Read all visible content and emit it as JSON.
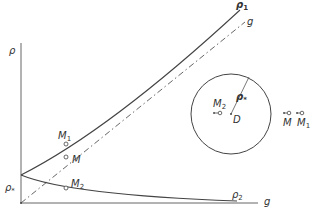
{
  "diagram": {
    "axes": {
      "y_label": "ρ",
      "x_label": "g"
    },
    "curves": {
      "upper": {
        "label": "ρ",
        "sub": "1"
      },
      "reference": {
        "label": "g"
      },
      "lower": {
        "label": "ρ",
        "sub": "2"
      }
    },
    "intercept_label": {
      "label": "ρ",
      "sub": "*"
    },
    "points": {
      "m1": {
        "label": "M",
        "sub": "1"
      },
      "m": {
        "label": "M",
        "sub": ""
      },
      "m2": {
        "label": "M",
        "sub": "2"
      }
    },
    "inset": {
      "radius_label": {
        "label": "ρ",
        "sub": "*"
      },
      "center_label": "D",
      "m2": {
        "label": "M",
        "sub": "2"
      },
      "m": {
        "label": "M",
        "sub": ""
      },
      "m1": {
        "label": "M",
        "sub": "1"
      }
    },
    "colors": {
      "line": "#555555",
      "text": "#333333"
    }
  }
}
